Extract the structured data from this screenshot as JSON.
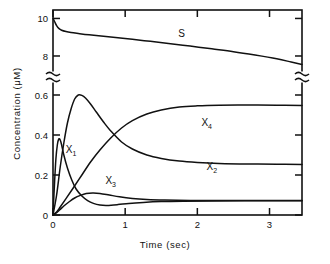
{
  "chart_data": {
    "type": "line",
    "title": "",
    "xlabel": "Time (sec)",
    "ylabel": "Concentration (μM)",
    "xlim": [
      0,
      3.45
    ],
    "xticks": [
      0,
      1,
      2,
      3
    ],
    "xticklabels": [
      "0",
      "1",
      "2",
      "3"
    ],
    "axis_break": {
      "axis": "y",
      "lower_range": [
        0,
        0.66
      ],
      "upper_range": [
        7.2,
        10.45
      ],
      "note": "y-axis has a break between the low-concentration and high-concentration regions"
    },
    "yticks_lower": [
      0,
      0.2,
      0.4,
      0.6
    ],
    "yticklabels_lower": [
      "0",
      "0.2",
      "0.4",
      "0.6"
    ],
    "yticks_upper": [
      8,
      10
    ],
    "yticklabels_upper": [
      "8",
      "10"
    ],
    "grid": false,
    "legend_position": "inline-annotations",
    "series": [
      {
        "name": "S",
        "label": "S",
        "label_at": [
          1.78,
          9.0
        ],
        "panel": "upper",
        "points": [
          [
            0.0,
            10.0
          ],
          [
            0.02,
            9.85
          ],
          [
            0.05,
            9.62
          ],
          [
            0.08,
            9.47
          ],
          [
            0.12,
            9.37
          ],
          [
            0.18,
            9.3
          ],
          [
            0.25,
            9.25
          ],
          [
            0.35,
            9.2
          ],
          [
            0.5,
            9.13
          ],
          [
            0.7,
            9.05
          ],
          [
            0.9,
            8.97
          ],
          [
            1.1,
            8.89
          ],
          [
            1.35,
            8.78
          ],
          [
            1.6,
            8.67
          ],
          [
            1.9,
            8.53
          ],
          [
            2.2,
            8.38
          ],
          [
            2.5,
            8.23
          ],
          [
            2.8,
            8.05
          ],
          [
            3.1,
            7.85
          ],
          [
            3.3,
            7.68
          ],
          [
            3.45,
            7.55
          ]
        ]
      },
      {
        "name": "X1",
        "label": "X",
        "sublabel": "1",
        "label_at": [
          0.25,
          0.31
        ],
        "panel": "lower",
        "points": [
          [
            0.0,
            0.0
          ],
          [
            0.02,
            0.15
          ],
          [
            0.04,
            0.28
          ],
          [
            0.06,
            0.35
          ],
          [
            0.08,
            0.38
          ],
          [
            0.1,
            0.375
          ],
          [
            0.12,
            0.35
          ],
          [
            0.15,
            0.3
          ],
          [
            0.2,
            0.235
          ],
          [
            0.26,
            0.175
          ],
          [
            0.32,
            0.13
          ],
          [
            0.4,
            0.095
          ],
          [
            0.48,
            0.072
          ],
          [
            0.56,
            0.058
          ],
          [
            0.65,
            0.05
          ],
          [
            0.75,
            0.048
          ],
          [
            0.9,
            0.052
          ],
          [
            1.05,
            0.058
          ],
          [
            1.25,
            0.063
          ],
          [
            1.5,
            0.067
          ],
          [
            1.8,
            0.069
          ],
          [
            2.2,
            0.07
          ],
          [
            2.8,
            0.071
          ],
          [
            3.45,
            0.071
          ]
        ]
      },
      {
        "name": "X2",
        "label": "X",
        "sublabel": "2",
        "label_at": [
          2.2,
          0.225
        ],
        "panel": "lower",
        "points": [
          [
            0.0,
            0.0
          ],
          [
            0.05,
            0.1
          ],
          [
            0.1,
            0.24
          ],
          [
            0.15,
            0.36
          ],
          [
            0.2,
            0.46
          ],
          [
            0.25,
            0.53
          ],
          [
            0.3,
            0.58
          ],
          [
            0.35,
            0.6
          ],
          [
            0.4,
            0.598
          ],
          [
            0.45,
            0.585
          ],
          [
            0.52,
            0.555
          ],
          [
            0.6,
            0.515
          ],
          [
            0.7,
            0.465
          ],
          [
            0.8,
            0.42
          ],
          [
            0.95,
            0.365
          ],
          [
            1.1,
            0.33
          ],
          [
            1.3,
            0.3
          ],
          [
            1.5,
            0.283
          ],
          [
            1.75,
            0.27
          ],
          [
            2.0,
            0.263
          ],
          [
            2.3,
            0.258
          ],
          [
            2.7,
            0.255
          ],
          [
            3.1,
            0.254
          ],
          [
            3.45,
            0.253
          ]
        ]
      },
      {
        "name": "X3",
        "label": "X",
        "sublabel": "3",
        "label_at": [
          0.8,
          0.155
        ],
        "panel": "lower",
        "points": [
          [
            0.0,
            0.0
          ],
          [
            0.05,
            0.012
          ],
          [
            0.1,
            0.028
          ],
          [
            0.15,
            0.045
          ],
          [
            0.22,
            0.065
          ],
          [
            0.3,
            0.085
          ],
          [
            0.38,
            0.098
          ],
          [
            0.46,
            0.107
          ],
          [
            0.55,
            0.11
          ],
          [
            0.65,
            0.108
          ],
          [
            0.78,
            0.1
          ],
          [
            0.92,
            0.091
          ],
          [
            1.1,
            0.083
          ],
          [
            1.3,
            0.078
          ],
          [
            1.55,
            0.075
          ],
          [
            1.9,
            0.073
          ],
          [
            2.4,
            0.072
          ],
          [
            3.0,
            0.072
          ],
          [
            3.45,
            0.072
          ]
        ]
      },
      {
        "name": "X4",
        "label": "X",
        "sublabel": "4",
        "label_at": [
          2.13,
          0.445
        ],
        "panel": "lower",
        "points": [
          [
            0.0,
            0.0
          ],
          [
            0.05,
            0.015
          ],
          [
            0.1,
            0.04
          ],
          [
            0.18,
            0.082
          ],
          [
            0.28,
            0.135
          ],
          [
            0.4,
            0.2
          ],
          [
            0.52,
            0.265
          ],
          [
            0.65,
            0.325
          ],
          [
            0.8,
            0.385
          ],
          [
            0.95,
            0.435
          ],
          [
            1.1,
            0.472
          ],
          [
            1.3,
            0.505
          ],
          [
            1.5,
            0.525
          ],
          [
            1.75,
            0.54
          ],
          [
            2.0,
            0.546
          ],
          [
            2.3,
            0.549
          ],
          [
            2.7,
            0.55
          ],
          [
            3.1,
            0.549
          ],
          [
            3.45,
            0.548
          ]
        ]
      }
    ]
  }
}
